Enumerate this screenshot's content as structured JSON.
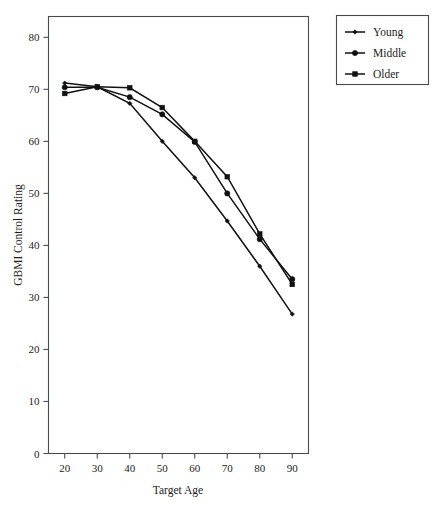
{
  "chart_data": {
    "type": "line",
    "title": "",
    "xlabel": "Target Age",
    "ylabel": "GBMI Control Rating",
    "x": [
      20,
      30,
      40,
      50,
      60,
      70,
      80,
      90
    ],
    "xlim": [
      15,
      95
    ],
    "ylim": [
      0,
      84
    ],
    "xticks": [
      "20",
      "30",
      "40",
      "50",
      "60",
      "70",
      "80",
      "90"
    ],
    "yticks": [
      "0",
      "10",
      "20",
      "30",
      "40",
      "50",
      "60",
      "70",
      "80"
    ],
    "grid": false,
    "legend_position": "outside-top-right",
    "series": [
      {
        "name": "Young",
        "marker": "diamond",
        "color": "#111111",
        "values": [
          71.2,
          70.5,
          67.3,
          60.0,
          53.0,
          44.7,
          36.0,
          26.8
        ]
      },
      {
        "name": "Middle",
        "marker": "circle",
        "color": "#111111",
        "values": [
          70.4,
          70.4,
          68.5,
          65.2,
          59.9,
          50.0,
          41.2,
          33.5
        ]
      },
      {
        "name": "Older",
        "marker": "square",
        "color": "#111111",
        "values": [
          69.2,
          70.5,
          70.3,
          66.5,
          60.0,
          53.2,
          42.2,
          32.5
        ]
      }
    ]
  },
  "legend": {
    "entries": [
      {
        "label": "Young",
        "marker": "diamond"
      },
      {
        "label": "Middle",
        "marker": "circle"
      },
      {
        "label": "Older",
        "marker": "square"
      }
    ]
  },
  "axes": {
    "x_title": "Target Age",
    "y_title": "GBMI Control Rating"
  }
}
